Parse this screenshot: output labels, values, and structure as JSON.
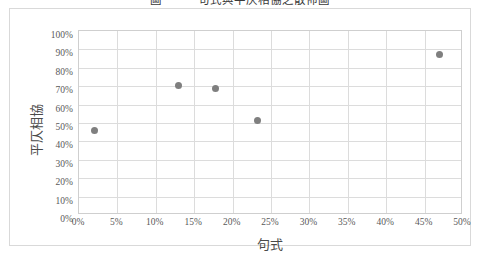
{
  "figure": {
    "title": "圖一　　句式與平仄相協之散佈圖",
    "title_clipped": true
  },
  "chart_data": {
    "type": "scatter",
    "title": "",
    "xlabel": "句式",
    "ylabel": "平仄相協",
    "xlim": [
      0,
      50
    ],
    "ylim": [
      0,
      100
    ],
    "grid": true,
    "legend": "none",
    "marker_color": "#7f7f7f",
    "x_tick_labels": [
      "0%",
      "5%",
      "10%",
      "15%",
      "20%",
      "25%",
      "30%",
      "35%",
      "40%",
      "45%",
      "50%"
    ],
    "x_tick_values": [
      0,
      5,
      10,
      15,
      20,
      25,
      30,
      35,
      40,
      45,
      50
    ],
    "y_tick_labels": [
      "0%",
      "10%",
      "20%",
      "30%",
      "40%",
      "50%",
      "60%",
      "70%",
      "80%",
      "90%",
      "100%"
    ],
    "y_tick_values": [
      0,
      10,
      20,
      30,
      40,
      50,
      60,
      70,
      80,
      90,
      100
    ],
    "points": [
      {
        "x": 2.0,
        "y": 46.0
      },
      {
        "x": 12.9,
        "y": 70.5
      },
      {
        "x": 17.8,
        "y": 68.5
      },
      {
        "x": 23.2,
        "y": 51.5
      },
      {
        "x": 46.9,
        "y": 87.0
      }
    ]
  },
  "colors": {
    "marker": "#7f7f7f",
    "gridline": "#dcdcdc",
    "plot_border": "#cfcfcf",
    "frame_border": "#d9d9d9",
    "axis_text": "#595959",
    "axis_title_text": "#4a4a4a"
  }
}
